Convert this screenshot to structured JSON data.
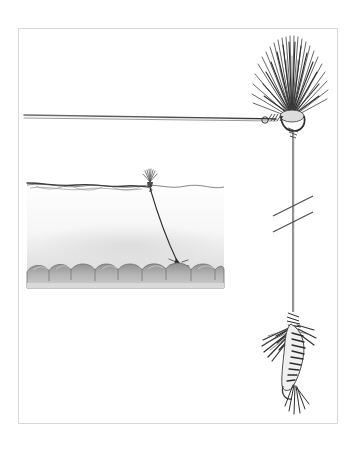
{
  "figure": {
    "medium": "pencil and ink wash drawing",
    "background_color": "#ffffff",
    "ink_color": "#333333",
    "frame": {
      "x": 18,
      "y": 28,
      "width": 320,
      "height": 396,
      "border_color": "#d8d8d8",
      "border_width": 1
    }
  },
  "panels": [
    {
      "name": "rig-detail-panel",
      "label": "Dry-dropper rig detail",
      "region": {
        "x": 240,
        "y": 35,
        "width": 98,
        "height": 385
      }
    },
    {
      "name": "underwater-cross-section-panel",
      "label": "Underwater cross-section",
      "region": {
        "x": 26,
        "y": 168,
        "width": 200,
        "height": 122
      }
    }
  ],
  "rig": {
    "fly_line": {
      "name": "fly-line",
      "label": "Fly line and leader",
      "x1": 24,
      "y1": 116,
      "x2": 276,
      "y2": 120,
      "color": "#555555"
    },
    "knot": {
      "name": "clinch-knot",
      "label": "Knot at hook eye",
      "x": 282,
      "y": 123
    },
    "dry_fly": {
      "name": "dry-fly",
      "label": "Bushy hackle dry fly",
      "center_x": 292,
      "center_y": 92,
      "hackle_fiber_count": 46,
      "hackle_radius": 46,
      "color": "#3a3a3a"
    },
    "tippet": {
      "name": "dropper-tippet",
      "label": "Dropper tippet",
      "x": 293,
      "y_top": 132,
      "y_bottom": 312,
      "color": "#4a4a4a"
    },
    "break_marks": {
      "name": "break-marks",
      "label": "Line break symbol (line continues)",
      "x": 293,
      "y": 210,
      "count": 2,
      "length": 40
    },
    "nymph": {
      "name": "nymph-fly",
      "label": "Weighted nymph dropper fly",
      "center_x": 295,
      "center_y": 365,
      "color": "#3a3a3a"
    }
  },
  "cross_section": {
    "water_surface": {
      "name": "water-surface-line",
      "label": "Water surface",
      "y": 186,
      "x_left": 27,
      "x_right": 224,
      "color": "#6b6b6b"
    },
    "surface_leader": {
      "name": "floating-leader",
      "label": "Leader floating on surface",
      "x1": 27,
      "y1": 184,
      "x2": 150,
      "y2": 187
    },
    "surface_fly": {
      "name": "surface-dry-fly",
      "label": "Dry fly riding the surface film",
      "x": 150,
      "y": 178
    },
    "dropper_line": {
      "name": "submerged-dropper-line",
      "label": "Dropper line to nymph",
      "x1": 150,
      "y1": 188,
      "x2": 180,
      "y2": 264
    },
    "submerged_nymph": {
      "name": "submerged-nymph",
      "label": "Nymph drifting near the bottom",
      "x": 181,
      "y": 266
    },
    "water_body": {
      "name": "water-body",
      "label": "Water column",
      "top": 186,
      "bottom": 268,
      "color_top": "#fcfcfc",
      "color_bottom": "#e4e4e4"
    },
    "streambed": {
      "name": "streambed-rocks",
      "label": "Rounded streambed rocks",
      "y": 266,
      "height": 22,
      "rock_count": 7,
      "color": "#a9a9a9"
    }
  }
}
